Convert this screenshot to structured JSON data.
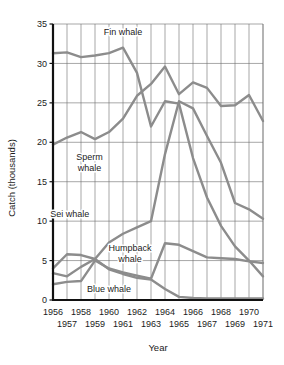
{
  "chart_data": {
    "type": "line",
    "title": "",
    "xlabel": "Year",
    "ylabel": "Catch (thousands)",
    "x": [
      1956,
      1957,
      1958,
      1959,
      1960,
      1961,
      1962,
      1963,
      1964,
      1965,
      1966,
      1967,
      1968,
      1969,
      1970,
      1971
    ],
    "xlim": [
      1956,
      1971
    ],
    "ylim": [
      0,
      35
    ],
    "ytick_labels": [
      "0",
      "5",
      "10",
      "15",
      "20",
      "25",
      "30",
      "35"
    ],
    "yticks": [
      0,
      5,
      10,
      15,
      20,
      25,
      30,
      35
    ],
    "xtick_labels_top": [
      "1956",
      "1958",
      "1960",
      "1962",
      "1964",
      "1966",
      "1968",
      "1970"
    ],
    "xtick_labels_bottom": [
      "1957",
      "1959",
      "1961",
      "1963",
      "1965",
      "1967",
      "1969",
      "1971"
    ],
    "grid": true,
    "legend_position": "inline-annotations",
    "series": [
      {
        "name": "Fin whale",
        "color": "#8c8c8c",
        "label_x": 1961.0,
        "label_y": 33.6,
        "values": [
          31.3,
          31.4,
          30.8,
          31.0,
          31.3,
          32.0,
          28.8,
          22.0,
          25.2,
          24.9,
          18.0,
          13.0,
          9.4,
          6.8,
          5.0,
          3.0
        ]
      },
      {
        "name": "Sperm whale",
        "color": "#8c8c8c",
        "label_x": 1958.6,
        "label_y": 17.7,
        "values": [
          19.7,
          20.6,
          21.3,
          20.4,
          21.3,
          23.0,
          25.9,
          27.4,
          29.6,
          26.1,
          27.6,
          26.9,
          24.6,
          24.7,
          26.0,
          22.7
        ]
      },
      {
        "name": "Sei whale",
        "color": "#8c8c8c",
        "label_x": 1957.2,
        "label_y": 10.5,
        "values": [
          3.4,
          3.0,
          4.2,
          5.2,
          7.3,
          8.4,
          9.2,
          10.0,
          18.5,
          25.2,
          24.3,
          20.8,
          17.4,
          12.3,
          11.5,
          10.3
        ]
      },
      {
        "name": "Humpback whale",
        "color": "#8c8c8c",
        "label_x": 1961.5,
        "label_y": 6.2,
        "values": [
          4.0,
          5.8,
          5.7,
          5.2,
          3.9,
          3.3,
          2.8,
          2.6,
          1.4,
          0.4,
          0.25,
          0.2,
          0.2,
          0.2,
          0.2,
          0.2
        ]
      },
      {
        "name": "Blue whale",
        "color": "#8c8c8c",
        "label_x": 1960.0,
        "label_y": 1.0,
        "values": [
          2.0,
          2.3,
          2.4,
          5.0,
          4.0,
          3.5,
          3.1,
          2.7,
          7.2,
          7.0,
          6.2,
          5.4,
          5.3,
          5.2,
          4.9,
          4.7
        ]
      }
    ]
  },
  "axes": {
    "y_axis_title": "Catch (thousands)",
    "x_axis_title": "Year"
  },
  "colors": {
    "series_line": "#8c8c8c",
    "grid": "#6b6b6b",
    "axis": "#111111",
    "text": "#1b1b1b",
    "background": "#ffffff"
  }
}
